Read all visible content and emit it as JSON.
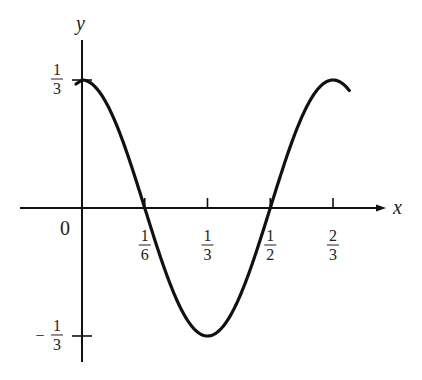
{
  "chart_data": {
    "type": "line",
    "title": "",
    "function": "y = (1/3) cos(3*pi*x)",
    "xlabel": "x",
    "ylabel": "y",
    "xlim": [
      -0.17,
      0.82
    ],
    "ylim": [
      -0.4,
      0.42
    ],
    "x_ticks": [
      {
        "value": 0.1667,
        "label_num": "1",
        "label_den": "6"
      },
      {
        "value": 0.3333,
        "label_num": "1",
        "label_den": "3"
      },
      {
        "value": 0.5,
        "label_num": "1",
        "label_den": "2"
      },
      {
        "value": 0.6667,
        "label_num": "2",
        "label_den": "3"
      }
    ],
    "y_ticks": [
      {
        "value": 0.3333,
        "label_num": "1",
        "label_den": "3",
        "sign": ""
      },
      {
        "value": -0.3333,
        "label_num": "1",
        "label_den": "3",
        "sign": "−"
      }
    ],
    "origin_label": "0",
    "series": [
      {
        "name": "curve",
        "x_range": [
          0,
          0.71
        ],
        "color": "#111111"
      }
    ],
    "grid": false,
    "legend": null
  }
}
